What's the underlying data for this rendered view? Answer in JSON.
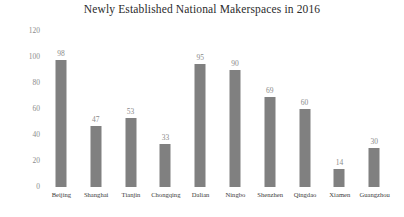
{
  "chart_data": {
    "type": "bar",
    "title": "Newly Established National Makerspaces in 2016",
    "xlabel": "",
    "ylabel": "",
    "categories": [
      "Beijing",
      "Shanghai",
      "Tianjin",
      "Chongqing",
      "Dalian",
      "Ningbo",
      "Shenzhen",
      "Qingdao",
      "Xiamen",
      "Guangzhou"
    ],
    "values": [
      98,
      47,
      53,
      33,
      95,
      90,
      69,
      60,
      14,
      30
    ],
    "ylim": [
      0,
      120
    ],
    "yticks": [
      "0",
      "20",
      "40",
      "60",
      "80",
      "100",
      "120"
    ],
    "ytick_values": [
      0,
      20,
      40,
      60,
      80,
      100,
      120
    ],
    "grid": false,
    "legend": false,
    "bar_color": "#808080",
    "value_label_color": "#8a8a8a",
    "tick_label_color": "#8c8c8c",
    "title_color": "#2b2b2b",
    "background_color": "#ffffff"
  }
}
